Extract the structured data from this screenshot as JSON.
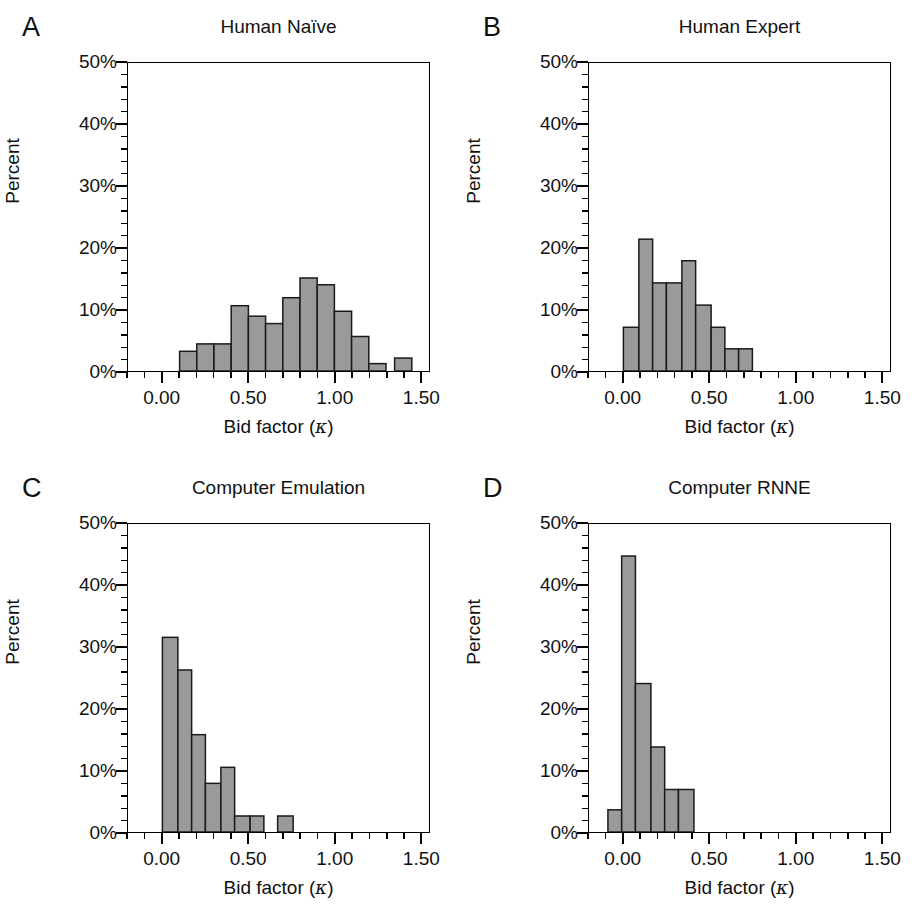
{
  "figure": {
    "panel_count": 4,
    "bar_fill": "#9a9a9a",
    "bar_stroke": "#1a1a1a",
    "axis_color": "#000000",
    "background": "#ffffff"
  },
  "axes": {
    "ylabel": "Percent",
    "xlabel_prefix": "Bid factor (",
    "xlabel_symbol": "κ",
    "xlabel_suffix": ")",
    "xlabel_full": "Bid factor (κ)",
    "ytick_labels": [
      "50%",
      "40%",
      "30%",
      "20%",
      "10%",
      "0%"
    ],
    "ytick_values": [
      50,
      40,
      30,
      20,
      10,
      0
    ],
    "xtick_labels": [
      "0.00",
      "0.50",
      "1.00",
      "1.50"
    ],
    "xtick_values": [
      0.0,
      0.5,
      1.0,
      1.5
    ],
    "ylim": [
      0,
      50
    ],
    "xlim": [
      -0.2,
      1.55
    ],
    "y_minor_step": 2,
    "x_minor_step": 0.1,
    "grid": false,
    "legend": false
  },
  "panels": [
    {
      "letter": "A",
      "title": "Human Naïve"
    },
    {
      "letter": "B",
      "title": "Human Expert"
    },
    {
      "letter": "C",
      "title": "Computer Emulation"
    },
    {
      "letter": "D",
      "title": "Computer RNNE"
    }
  ],
  "chart_data": [
    {
      "type": "bar",
      "panel": "A",
      "title": "Human Naïve",
      "xlabel": "Bid factor (κ)",
      "ylabel": "Percent",
      "ylim": [
        0,
        50
      ],
      "xlim": [
        -0.2,
        1.55
      ],
      "grid": false,
      "bin_width": 0.1,
      "bin_starts": [
        0.1,
        0.2,
        0.3,
        0.4,
        0.5,
        0.6,
        0.7,
        0.8,
        0.9,
        1.0,
        1.2,
        1.4,
        1.5
      ],
      "values": [
        3.2,
        4.4,
        4.4,
        10.6,
        8.9,
        7.7,
        11.9,
        15.1,
        14.0,
        9.7,
        5.6,
        1.2,
        2.1,
        2.1,
        1.2
      ],
      "bars": [
        {
          "x0": 0.1,
          "x1": 0.2,
          "y": 3.2
        },
        {
          "x0": 0.2,
          "x1": 0.3,
          "y": 4.4
        },
        {
          "x0": 0.3,
          "x1": 0.4,
          "y": 4.4
        },
        {
          "x0": 0.4,
          "x1": 0.5,
          "y": 10.6
        },
        {
          "x0": 0.5,
          "x1": 0.6,
          "y": 8.9
        },
        {
          "x0": 0.6,
          "x1": 0.7,
          "y": 7.7
        },
        {
          "x0": 0.7,
          "x1": 0.8,
          "y": 11.9
        },
        {
          "x0": 0.8,
          "x1": 0.9,
          "y": 15.1
        },
        {
          "x0": 0.9,
          "x1": 1.0,
          "y": 14.0
        },
        {
          "x0": 1.0,
          "x1": 1.1,
          "y": 9.7
        },
        {
          "x0": 1.1,
          "x1": 1.2,
          "y": 5.6
        },
        {
          "x0": 1.2,
          "x1": 1.3,
          "y": 1.2
        },
        {
          "x0": 1.35,
          "x1": 1.45,
          "y": 2.1
        },
        {
          "x0": 1.55,
          "x1": 1.65,
          "y": 2.1
        },
        {
          "x0": 1.65,
          "x1": 1.72,
          "y": 1.2
        }
      ]
    },
    {
      "type": "bar",
      "panel": "B",
      "title": "Human Expert",
      "xlabel": "Bid factor (κ)",
      "ylabel": "Percent",
      "ylim": [
        0,
        50
      ],
      "xlim": [
        -0.2,
        1.55
      ],
      "grid": false,
      "bin_width": 0.09,
      "values": [
        7.1,
        21.4,
        14.3,
        14.3,
        17.9,
        10.7,
        7.1,
        3.6,
        3.6
      ],
      "bars": [
        {
          "x0": 0.0,
          "x1": 0.09,
          "y": 7.1
        },
        {
          "x0": 0.09,
          "x1": 0.17,
          "y": 21.4
        },
        {
          "x0": 0.17,
          "x1": 0.25,
          "y": 14.3
        },
        {
          "x0": 0.25,
          "x1": 0.34,
          "y": 14.3
        },
        {
          "x0": 0.34,
          "x1": 0.42,
          "y": 17.9
        },
        {
          "x0": 0.42,
          "x1": 0.51,
          "y": 10.7
        },
        {
          "x0": 0.51,
          "x1": 0.59,
          "y": 7.1
        },
        {
          "x0": 0.59,
          "x1": 0.67,
          "y": 3.6
        },
        {
          "x0": 0.67,
          "x1": 0.75,
          "y": 3.6
        }
      ]
    },
    {
      "type": "bar",
      "panel": "C",
      "title": "Computer Emulation",
      "xlabel": "Bid factor (κ)",
      "ylabel": "Percent",
      "ylim": [
        0,
        50
      ],
      "xlim": [
        -0.2,
        1.55
      ],
      "grid": false,
      "bin_width": 0.09,
      "values": [
        31.6,
        26.3,
        15.8,
        7.9,
        10.5,
        2.6,
        2.6,
        2.6
      ],
      "bars": [
        {
          "x0": 0.0,
          "x1": 0.09,
          "y": 31.6
        },
        {
          "x0": 0.09,
          "x1": 0.17,
          "y": 26.3
        },
        {
          "x0": 0.17,
          "x1": 0.25,
          "y": 15.8
        },
        {
          "x0": 0.25,
          "x1": 0.34,
          "y": 7.9
        },
        {
          "x0": 0.34,
          "x1": 0.42,
          "y": 10.5
        },
        {
          "x0": 0.42,
          "x1": 0.51,
          "y": 2.6
        },
        {
          "x0": 0.51,
          "x1": 0.59,
          "y": 2.6
        },
        {
          "x0": 0.67,
          "x1": 0.76,
          "y": 2.6
        }
      ]
    },
    {
      "type": "bar",
      "panel": "D",
      "title": "Computer RNNE",
      "xlabel": "Bid factor (κ)",
      "ylabel": "Percent",
      "ylim": [
        0,
        50
      ],
      "xlim": [
        -0.2,
        1.55
      ],
      "grid": false,
      "bin_width": 0.085,
      "values": [
        3.6,
        44.8,
        24.1,
        13.8,
        6.9,
        6.9
      ],
      "bars": [
        {
          "x0": -0.09,
          "x1": -0.01,
          "y": 3.6
        },
        {
          "x0": -0.01,
          "x1": 0.07,
          "y": 44.8
        },
        {
          "x0": 0.07,
          "x1": 0.16,
          "y": 24.1
        },
        {
          "x0": 0.16,
          "x1": 0.24,
          "y": 13.8
        },
        {
          "x0": 0.24,
          "x1": 0.32,
          "y": 6.9
        },
        {
          "x0": 0.32,
          "x1": 0.41,
          "y": 6.9
        }
      ]
    }
  ]
}
